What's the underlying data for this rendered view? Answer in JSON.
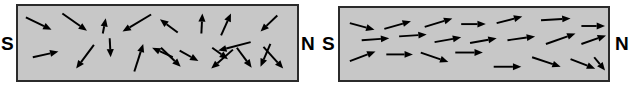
{
  "figure": {
    "width": 644,
    "height": 93,
    "background_color": "#ffffff"
  },
  "style": {
    "panel_fill": "#c7c7c7",
    "panel_border": "#2b2b2b",
    "arrow_color": "#000000",
    "label_color": "#000000"
  },
  "panels": [
    {
      "id": "disordered-domain",
      "state_label": "random",
      "south_label": "S",
      "north_label": "N",
      "box": {
        "x": 16,
        "y": 4,
        "width": 283,
        "height": 78
      },
      "south_label_pos": {
        "x": 1,
        "y": 34
      },
      "north_label_pos": {
        "x": 301,
        "y": 34
      },
      "arrows": [
        {
          "x1": 24,
          "y1": 16,
          "x2": 50,
          "y2": 29
        },
        {
          "x1": 61,
          "y1": 12,
          "x2": 86,
          "y2": 30
        },
        {
          "x1": 102,
          "y1": 33,
          "x2": 105,
          "y2": 17
        },
        {
          "x1": 151,
          "y1": 13,
          "x2": 122,
          "y2": 31
        },
        {
          "x1": 178,
          "y1": 32,
          "x2": 160,
          "y2": 18
        },
        {
          "x1": 202,
          "y1": 33,
          "x2": 203,
          "y2": 12
        },
        {
          "x1": 222,
          "y1": 35,
          "x2": 232,
          "y2": 12
        },
        {
          "x1": 279,
          "y1": 14,
          "x2": 262,
          "y2": 31
        },
        {
          "x1": 31,
          "y1": 58,
          "x2": 57,
          "y2": 52
        },
        {
          "x1": 93,
          "y1": 45,
          "x2": 75,
          "y2": 70
        },
        {
          "x1": 109,
          "y1": 38,
          "x2": 110,
          "y2": 58
        },
        {
          "x1": 134,
          "y1": 73,
          "x2": 143,
          "y2": 44
        },
        {
          "x1": 173,
          "y1": 58,
          "x2": 152,
          "y2": 48
        },
        {
          "x1": 161,
          "y1": 48,
          "x2": 181,
          "y2": 68
        },
        {
          "x1": 180,
          "y1": 51,
          "x2": 199,
          "y2": 62
        },
        {
          "x1": 213,
          "y1": 48,
          "x2": 229,
          "y2": 60
        },
        {
          "x1": 252,
          "y1": 42,
          "x2": 219,
          "y2": 51
        },
        {
          "x1": 234,
          "y1": 50,
          "x2": 212,
          "y2": 70
        },
        {
          "x1": 238,
          "y1": 48,
          "x2": 253,
          "y2": 69
        },
        {
          "x1": 272,
          "y1": 44,
          "x2": 262,
          "y2": 68
        },
        {
          "x1": 265,
          "y1": 47,
          "x2": 285,
          "y2": 70
        }
      ]
    },
    {
      "id": "aligned-domain",
      "state_label": "aligned",
      "south_label": "S",
      "north_label": "N",
      "box": {
        "x": 338,
        "y": 6,
        "width": 272,
        "height": 76
      },
      "south_label_pos": {
        "x": 322,
        "y": 34
      },
      "north_label_pos": {
        "x": 615,
        "y": 34
      },
      "arrows": [
        {
          "x1": 348,
          "y1": 22,
          "x2": 373,
          "y2": 29
        },
        {
          "x1": 383,
          "y1": 28,
          "x2": 410,
          "y2": 20
        },
        {
          "x1": 424,
          "y1": 26,
          "x2": 452,
          "y2": 17
        },
        {
          "x1": 461,
          "y1": 23,
          "x2": 486,
          "y2": 23
        },
        {
          "x1": 497,
          "y1": 22,
          "x2": 523,
          "y2": 15
        },
        {
          "x1": 542,
          "y1": 19,
          "x2": 572,
          "y2": 17
        },
        {
          "x1": 583,
          "y1": 25,
          "x2": 607,
          "y2": 25
        },
        {
          "x1": 360,
          "y1": 40,
          "x2": 388,
          "y2": 38
        },
        {
          "x1": 398,
          "y1": 36,
          "x2": 426,
          "y2": 34
        },
        {
          "x1": 434,
          "y1": 42,
          "x2": 461,
          "y2": 37
        },
        {
          "x1": 470,
          "y1": 43,
          "x2": 497,
          "y2": 38
        },
        {
          "x1": 508,
          "y1": 40,
          "x2": 536,
          "y2": 36
        },
        {
          "x1": 547,
          "y1": 44,
          "x2": 577,
          "y2": 33
        },
        {
          "x1": 583,
          "y1": 44,
          "x2": 608,
          "y2": 35
        },
        {
          "x1": 348,
          "y1": 62,
          "x2": 374,
          "y2": 52
        },
        {
          "x1": 385,
          "y1": 55,
          "x2": 412,
          "y2": 55
        },
        {
          "x1": 420,
          "y1": 53,
          "x2": 448,
          "y2": 63
        },
        {
          "x1": 455,
          "y1": 53,
          "x2": 483,
          "y2": 53
        },
        {
          "x1": 494,
          "y1": 68,
          "x2": 522,
          "y2": 68
        },
        {
          "x1": 533,
          "y1": 58,
          "x2": 562,
          "y2": 68
        },
        {
          "x1": 572,
          "y1": 60,
          "x2": 597,
          "y2": 70
        },
        {
          "x1": 596,
          "y1": 58,
          "x2": 607,
          "y2": 72
        }
      ]
    }
  ]
}
